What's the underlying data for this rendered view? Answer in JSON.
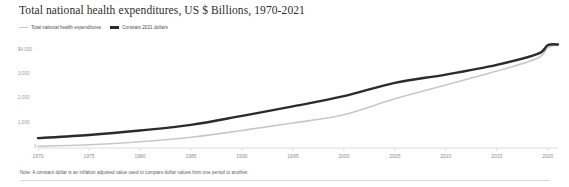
{
  "chart_data": {
    "type": "line",
    "title": "Total national health expenditures, US $ Billions, 1970-2021",
    "xlabel": "",
    "ylabel": "",
    "xlim": [
      1970,
      2021
    ],
    "ylim": [
      0,
      4400
    ],
    "grid": false,
    "legend_position": "top-left",
    "ytick_labels": [
      "$4,000",
      "3,000",
      "2,000",
      "1,000",
      "0"
    ],
    "ytick_values": [
      4000,
      3000,
      2000,
      1000,
      0
    ],
    "xtick_labels": [
      "1970",
      "1975",
      "1980",
      "1985",
      "1990",
      "1995",
      "2000",
      "2005",
      "2010",
      "2015",
      "2020"
    ],
    "xtick_values": [
      1970,
      1975,
      1980,
      1985,
      1990,
      1995,
      2000,
      2005,
      2010,
      2015,
      2020
    ],
    "x": [
      1970,
      1975,
      1980,
      1985,
      1990,
      1995,
      2000,
      2005,
      2010,
      2015,
      2019,
      2020,
      2021
    ],
    "series": [
      {
        "name": "Total national health expenditures",
        "color": "#c8c8c8",
        "values": [
          74,
          133,
          255,
          442,
          721,
          1027,
          1370,
          2024,
          2589,
          3163,
          3691,
          4124,
          4255
        ]
      },
      {
        "name": "Constant 2021 dollars",
        "color": "#2b2b2b",
        "values": [
          405,
          535,
          720,
          950,
          1320,
          1710,
          2130,
          2680,
          3020,
          3420,
          3870,
          4230,
          4255
        ]
      }
    ],
    "footnote": "Note: A constant dollar is an inflation adjusted value used to compare dollar values from one period to another."
  }
}
